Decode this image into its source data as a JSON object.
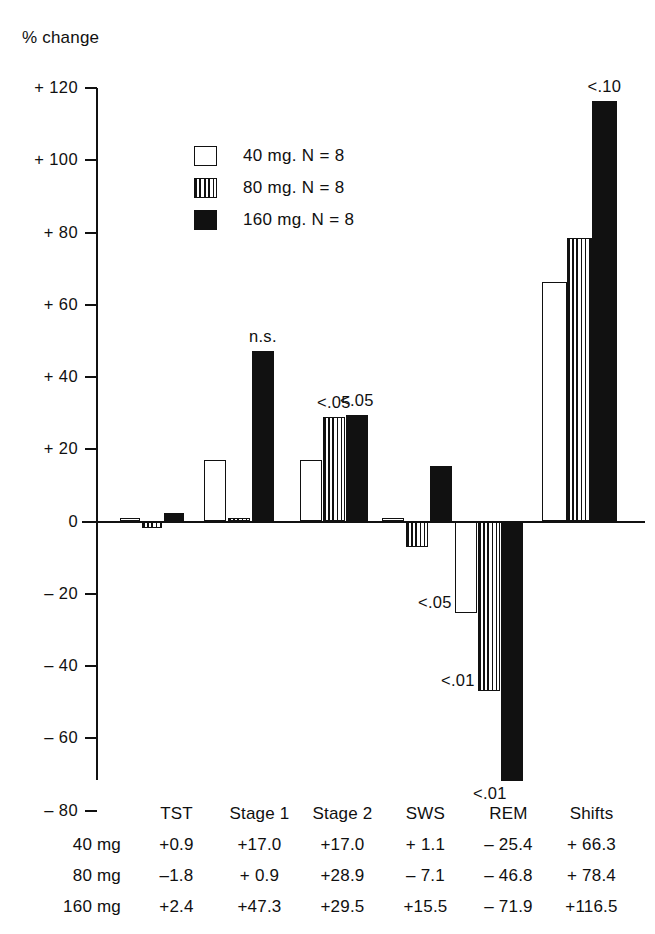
{
  "chart_data": {
    "type": "bar",
    "title": "% change",
    "ylabel": "% change",
    "xlabel": "",
    "ylim": [
      -80,
      120
    ],
    "yticks": [
      "+ 120",
      "+ 100",
      "+ 80",
      "+ 60",
      "+ 40",
      "+ 20",
      "0",
      "– 20",
      "– 40",
      "– 60",
      "– 80"
    ],
    "ytick_values": [
      120,
      100,
      80,
      60,
      40,
      20,
      0,
      -20,
      -40,
      -60,
      -80
    ],
    "grid": false,
    "legend_position": "upper-left-inside",
    "categories": [
      "TST",
      "Stage 1",
      "Stage 2",
      "SWS",
      "REM",
      "Shifts"
    ],
    "series": [
      {
        "name": "40 mg. N = 8",
        "style": "open",
        "values": [
          0.9,
          17.0,
          17.0,
          1.1,
          -25.4,
          66.3
        ]
      },
      {
        "name": "80 mg. N = 8",
        "style": "striped",
        "values": [
          -1.8,
          0.9,
          28.9,
          -7.1,
          -46.8,
          78.4
        ]
      },
      {
        "name": "160 mg. N = 8",
        "style": "solid",
        "values": [
          2.4,
          47.3,
          29.5,
          15.5,
          -71.9,
          116.5
        ]
      }
    ],
    "annotations": [
      {
        "text": "n.s.",
        "category": "Stage 1",
        "series": "160 mg. N = 8"
      },
      {
        "text": "<.05",
        "category": "Stage 2",
        "series": "80 mg. N = 8"
      },
      {
        "text": "<.05",
        "category": "Stage 2",
        "series": "160 mg. N = 8"
      },
      {
        "text": "<.05",
        "category": "REM",
        "series": "40 mg. N = 8"
      },
      {
        "text": "<.01",
        "category": "REM",
        "series": "80 mg. N = 8"
      },
      {
        "text": "<.01",
        "category": "REM",
        "series": "160 mg. N = 8"
      },
      {
        "text": "<.10",
        "category": "Shifts",
        "series": "160 mg. N = 8"
      }
    ]
  },
  "legend": {
    "items": [
      {
        "label": "40 mg. N = 8",
        "style": "open"
      },
      {
        "label": "80 mg. N = 8",
        "style": "striped"
      },
      {
        "label": "160 mg. N = 8",
        "style": "solid"
      }
    ]
  },
  "axis": {
    "title": "% change",
    "ticks": [
      {
        "label": "+ 120",
        "value": 120
      },
      {
        "label": "+ 100",
        "value": 100
      },
      {
        "label": "+ 80",
        "value": 80
      },
      {
        "label": "+ 60",
        "value": 60
      },
      {
        "label": "+ 40",
        "value": 40
      },
      {
        "label": "+ 20",
        "value": 20
      },
      {
        "label": "0",
        "value": 0
      },
      {
        "label": "– 20",
        "value": -20
      },
      {
        "label": "– 40",
        "value": -40
      },
      {
        "label": "– 60",
        "value": -60
      },
      {
        "label": "– 80",
        "value": -80
      }
    ]
  },
  "table": {
    "header": {
      "rowhead": "",
      "cells": [
        "TST",
        "Stage 1",
        "Stage 2",
        "SWS",
        "REM",
        "Shifts"
      ]
    },
    "rows": [
      {
        "rowhead": "40 mg",
        "cells": [
          "+0.9",
          "+17.0",
          "+17.0",
          "+  1.1",
          "– 25.4",
          "+  66.3"
        ]
      },
      {
        "rowhead": "80 mg",
        "cells": [
          "–1.8",
          "+  0.9",
          "+28.9",
          "–  7.1",
          "– 46.8",
          "+  78.4"
        ]
      },
      {
        "rowhead": "160 mg",
        "cells": [
          "+2.4",
          "+47.3",
          "+29.5",
          "+15.5",
          "– 71.9",
          "+116.5"
        ]
      }
    ]
  }
}
